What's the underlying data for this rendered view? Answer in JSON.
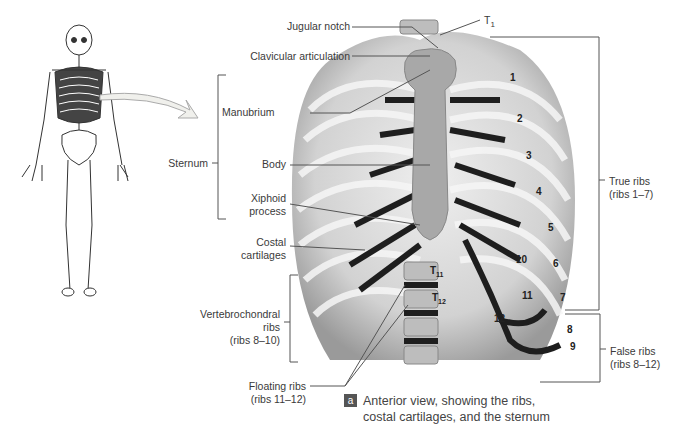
{
  "figure": {
    "caption_badge": "a",
    "caption_line1": "Anterior view, showing the ribs,",
    "caption_line2": "costal cartilages, and the sternum"
  },
  "labels": {
    "jugular_notch": "Jugular notch",
    "clavicular_articulation": "Clavicular articulation",
    "t1": "T",
    "t1_sub": "1",
    "manubrium": "Manubrium",
    "sternum": "Sternum",
    "body": "Body",
    "xiphoid_1": "Xiphoid",
    "xiphoid_2": "process",
    "costal_1": "Costal",
    "costal_2": "cartilages",
    "vertebro_1": "Vertebrochondral",
    "vertebro_2": "ribs",
    "vertebro_3": "(ribs 8–10)",
    "floating_1": "Floating ribs",
    "floating_2": "(ribs 11–12)",
    "true_1": "True ribs",
    "true_2": "(ribs 1–7)",
    "false_1": "False ribs",
    "false_2": "(ribs 8–12)"
  },
  "rib_numbers": [
    "1",
    "2",
    "3",
    "4",
    "5",
    "6",
    "7",
    "8",
    "9",
    "10",
    "11",
    "12"
  ],
  "vertebrae": {
    "t11": "T",
    "t11_sub": "11",
    "t12": "T",
    "t12_sub": "12"
  },
  "colors": {
    "rib": "#d9d9d9",
    "cartilage": "#1e1e1e",
    "sternum": "#a8a8a8",
    "line": "#555555"
  }
}
